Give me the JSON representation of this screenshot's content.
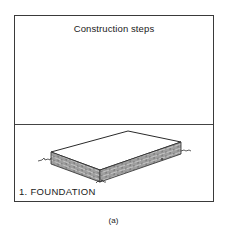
{
  "figure": {
    "title": "Construction steps",
    "step": {
      "number": "1.",
      "label": "1. FOUNDATION",
      "illustration": "brick-foundation-slab"
    },
    "caption": "(a)"
  },
  "colors": {
    "line": "#2a2a2a",
    "brick_fill": "#bdbdbd",
    "top_fill": "#ffffff"
  }
}
